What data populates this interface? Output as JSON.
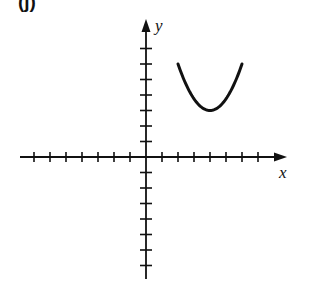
{
  "panel": {
    "label": "(j)"
  },
  "chart_data": {
    "type": "line",
    "title": "",
    "xlabel": "x",
    "ylabel": "y",
    "xlim": [
      -8,
      9
    ],
    "ylim": [
      -8,
      9
    ],
    "grid": false,
    "x_ticks": [
      -7,
      -6,
      -5,
      -4,
      -3,
      -2,
      -1,
      1,
      2,
      3,
      4,
      5,
      6,
      7
    ],
    "y_ticks": [
      -7,
      -6,
      -5,
      -4,
      -3,
      -2,
      -1,
      1,
      2,
      3,
      4,
      5,
      6,
      7
    ],
    "tick_labels_shown": false,
    "series": [
      {
        "name": "parabola",
        "description": "Upward-opening parabola, vertex at (4, 3), drawn from x=2 to x=6",
        "vertex": [
          4,
          3
        ],
        "x": [
          2,
          2.5,
          3,
          3.5,
          4,
          4.5,
          5,
          5.5,
          6
        ],
        "y": [
          6,
          4.69,
          3.75,
          3.19,
          3,
          3.19,
          3.75,
          4.69,
          6
        ],
        "color": "#111111"
      }
    ]
  },
  "layout": {
    "origin_px": [
      146,
      157
    ],
    "unit_x_px": 16,
    "unit_y_px": 15.5,
    "axis_color": "#111111"
  }
}
